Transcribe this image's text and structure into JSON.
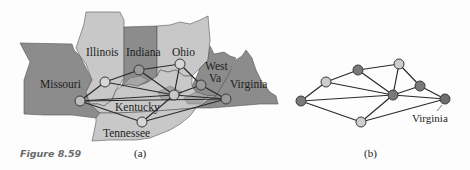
{
  "figure": {
    "label": "Figure 8.59",
    "panel_a_caption": "(a)",
    "panel_b_caption": "(b)"
  },
  "colors": {
    "dark_state": "#8c8c8c",
    "medium_state": "#a6a6a6",
    "light_state": "#c8c8c8",
    "dark_node": "#7a7a7a",
    "light_node": "#cdcdcd",
    "edge": "#2a2a2a",
    "background": "#fdfdfd"
  },
  "map": {
    "states": [
      {
        "name": "Missouri",
        "shade": "dark"
      },
      {
        "name": "Illinois",
        "shade": "light"
      },
      {
        "name": "Indiana",
        "shade": "dark"
      },
      {
        "name": "Ohio",
        "shade": "light"
      },
      {
        "name": "West Va",
        "shade": "dark"
      },
      {
        "name": "Virginia",
        "shade": "dark"
      },
      {
        "name": "Kentucky",
        "shade": "light"
      },
      {
        "name": "Tennessee",
        "shade": "light"
      }
    ],
    "labels": {
      "missouri": "Missouri",
      "illinois": "Illinois",
      "indiana": "Indiana",
      "ohio": "Ohio",
      "west_va_line1": "West",
      "west_va_line2": "Va",
      "virginia": "Virginia",
      "kentucky": "Kentucky",
      "tennessee": "Tennessee"
    }
  },
  "graph": {
    "nodes": [
      {
        "id": "MO",
        "state": "Missouri",
        "color": "dark"
      },
      {
        "id": "IL",
        "state": "Illinois",
        "color": "light"
      },
      {
        "id": "IN",
        "state": "Indiana",
        "color": "dark"
      },
      {
        "id": "OH",
        "state": "Ohio",
        "color": "light"
      },
      {
        "id": "KY",
        "state": "Kentucky",
        "color": "dark"
      },
      {
        "id": "WV",
        "state": "West Va",
        "color": "dark"
      },
      {
        "id": "VA",
        "state": "Virginia",
        "color": "dark"
      },
      {
        "id": "TN",
        "state": "Tennessee",
        "color": "light"
      }
    ],
    "edges": [
      [
        "MO",
        "IL"
      ],
      [
        "MO",
        "KY"
      ],
      [
        "MO",
        "TN"
      ],
      [
        "IL",
        "IN"
      ],
      [
        "IL",
        "KY"
      ],
      [
        "IN",
        "OH"
      ],
      [
        "IN",
        "KY"
      ],
      [
        "OH",
        "KY"
      ],
      [
        "OH",
        "WV"
      ],
      [
        "KY",
        "WV"
      ],
      [
        "KY",
        "VA"
      ],
      [
        "KY",
        "TN"
      ],
      [
        "WV",
        "VA"
      ],
      [
        "TN",
        "VA"
      ]
    ],
    "callout_label": "Virginia"
  }
}
